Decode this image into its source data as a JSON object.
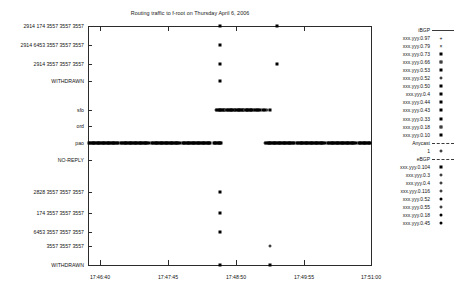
{
  "chart_data": {
    "type": "scatter",
    "title": "Routing traffic to f-root on Thursday April 6, 2006",
    "xlabel": "",
    "ylabel": "",
    "grid": false,
    "legend_position": "right",
    "x_axis": {
      "ticks": [
        "17:46:40",
        "17:47:45",
        "17:48:50",
        "17:49:55",
        "17:51:00"
      ],
      "range": [
        "17:46:40",
        "17:51:00"
      ]
    },
    "y_axis": {
      "categories": [
        "2914 174 3557 3557 3557",
        "2914 6453 3557 3557 3557",
        "2914 3557 3557 3557",
        "WITHDRAWN",
        "sfo",
        "ord",
        "pao",
        "NO-REPLY",
        "2828 3557 3557 3557",
        "174 3557 3557 3557",
        "6453 3557 3557 3557",
        "3557 3557 3557",
        "WITHDRAWN"
      ]
    },
    "series": [
      {
        "name": "xxx.yyy.0.97",
        "group": "iBGP",
        "marker": "plus",
        "points": []
      },
      {
        "name": "xxx.yyy.0.79",
        "group": "iBGP",
        "marker": "cross",
        "points": []
      },
      {
        "name": "xxx.yyy.0.73",
        "group": "iBGP",
        "marker": "filled-square",
        "points": []
      },
      {
        "name": "xxx.yyy.0.66",
        "group": "iBGP",
        "marker": "open-square",
        "points": []
      },
      {
        "name": "xxx.yyy.0.53",
        "group": "iBGP",
        "marker": "filled-square",
        "points": []
      },
      {
        "name": "xxx.yyy.0.52",
        "group": "iBGP",
        "marker": "open-circle",
        "points": []
      },
      {
        "name": "xxx.yyy.0.50",
        "group": "iBGP",
        "marker": "filled-square",
        "points": []
      },
      {
        "name": "xxx.yyy.0.4",
        "group": "iBGP",
        "marker": "filled-square",
        "points": []
      },
      {
        "name": "xxx.yyy.0.44",
        "group": "iBGP",
        "marker": "filled-square",
        "points": []
      },
      {
        "name": "xxx.yyy.0.43",
        "group": "iBGP",
        "marker": "filled-square",
        "points": []
      },
      {
        "name": "xxx.yyy.0.33",
        "group": "iBGP",
        "marker": "filled-square",
        "points": []
      },
      {
        "name": "xxx.yyy.0.18",
        "group": "iBGP",
        "marker": "open-square",
        "points": []
      },
      {
        "name": "xxx.yyy.0.10",
        "group": "iBGP",
        "marker": "filled-square",
        "points": []
      },
      {
        "name": "1",
        "group": "Anycast",
        "marker": "open-circle",
        "points": []
      },
      {
        "name": "xxx.yyy.0.104",
        "group": "eBGP",
        "marker": "filled-square",
        "points": []
      },
      {
        "name": "xxx.yyy.0.3",
        "group": "eBGP",
        "marker": "open-circle",
        "points": []
      },
      {
        "name": "xxx.yyy.0.4",
        "group": "eBGP",
        "marker": "open-circle",
        "points": []
      },
      {
        "name": "xxx.yyy.0.116",
        "group": "eBGP",
        "marker": "open-circle",
        "points": []
      },
      {
        "name": "xxx.yyy.0.52",
        "group": "eBGP",
        "marker": "filled-circle",
        "points": []
      },
      {
        "name": "xxx.yyy.0.55",
        "group": "eBGP",
        "marker": "open-circle",
        "points": []
      },
      {
        "name": "xxx.yyy.0.18",
        "group": "eBGP",
        "marker": "filled-circle",
        "points": []
      },
      {
        "name": "xxx.yyy.0.45",
        "group": "eBGP",
        "marker": "filled-circle",
        "points": []
      }
    ],
    "legend_groups": [
      {
        "header": "iBGP",
        "header_marker": "line",
        "entries": [
          {
            "label": "xxx.yyy.0.97",
            "marker": "plus"
          },
          {
            "label": "xxx.yyy.0.79",
            "marker": "cross"
          },
          {
            "label": "xxx.yyy.0.73",
            "marker": "filled-square"
          },
          {
            "label": "xxx.yyy.0.66",
            "marker": "open-square"
          },
          {
            "label": "xxx.yyy.0.53",
            "marker": "filled-square"
          },
          {
            "label": "xxx.yyy.0.52",
            "marker": "open-circle"
          },
          {
            "label": "xxx.yyy.0.50",
            "marker": "filled-square"
          },
          {
            "label": "xxx.yyy.0.4",
            "marker": "filled-square"
          },
          {
            "label": "xxx.yyy.0.44",
            "marker": "filled-square"
          },
          {
            "label": "xxx.yyy.0.43",
            "marker": "filled-square"
          },
          {
            "label": "xxx.yyy.0.33",
            "marker": "filled-square"
          },
          {
            "label": "xxx.yyy.0.18",
            "marker": "open-square"
          },
          {
            "label": "xxx.yyy.0.10",
            "marker": "filled-square"
          }
        ]
      },
      {
        "header": "Anycast",
        "header_marker": "dashed-line",
        "entries": [
          {
            "label": "1",
            "marker": "open-circle"
          }
        ]
      },
      {
        "header": "eBGP",
        "header_marker": "dashed-line",
        "entries": [
          {
            "label": "xxx.yyy.0.104",
            "marker": "filled-square"
          },
          {
            "label": "xxx.yyy.0.3",
            "marker": "open-circle"
          },
          {
            "label": "xxx.yyy.0.4",
            "marker": "open-circle"
          },
          {
            "label": "xxx.yyy.0.116",
            "marker": "open-circle"
          },
          {
            "label": "xxx.yyy.0.52",
            "marker": "filled-circle"
          },
          {
            "label": "xxx.yyy.0.55",
            "marker": "open-circle"
          },
          {
            "label": "xxx.yyy.0.18",
            "marker": "filled-circle"
          },
          {
            "label": "xxx.yyy.0.45",
            "marker": "filled-circle"
          }
        ]
      }
    ],
    "y_rows": [
      {
        "label": "2914 174 3557 3557 3557",
        "y": 26
      },
      {
        "label": "2914 6453 3557 3557 3557",
        "y": 45
      },
      {
        "label": "2914 3557 3557 3557",
        "y": 64
      },
      {
        "label": "WITHDRAWN",
        "y": 81
      },
      {
        "label": "sfo",
        "y": 110
      },
      {
        "label": "ord",
        "y": 126
      },
      {
        "label": "pao",
        "y": 143
      },
      {
        "label": "NO-REPLY",
        "y": 160
      },
      {
        "label": "2828 3557 3557 3557",
        "y": 192
      },
      {
        "label": "174 3557 3557 3557",
        "y": 213
      },
      {
        "label": "6453 3557 3557 3557",
        "y": 232
      },
      {
        "label": "3557 3557 3557",
        "y": 246
      },
      {
        "label": "WITHDRAWN",
        "y": 265
      }
    ],
    "x_ticks_px": [
      {
        "label": "17:46:40",
        "x": 100
      },
      {
        "label": "17:47:45",
        "x": 168
      },
      {
        "label": "17:48:50",
        "x": 236
      },
      {
        "label": "17:49:55",
        "x": 304
      },
      {
        "label": "17:51:00",
        "x": 371
      }
    ],
    "plotted_points": [
      {
        "x": 220,
        "y": 26,
        "marker": "filled-square"
      },
      {
        "x": 277,
        "y": 26,
        "marker": "filled-square"
      },
      {
        "x": 220,
        "y": 45,
        "marker": "filled-square"
      },
      {
        "x": 220,
        "y": 64,
        "marker": "filled-square"
      },
      {
        "x": 277,
        "y": 64,
        "marker": "filled-square"
      },
      {
        "x": 220,
        "y": 81,
        "marker": "filled-square"
      },
      {
        "x": 220,
        "y": 192,
        "marker": "filled-square"
      },
      {
        "x": 220,
        "y": 213,
        "marker": "filled-square"
      },
      {
        "x": 220,
        "y": 232,
        "marker": "filled-square"
      },
      {
        "x": 270,
        "y": 246,
        "marker": "open-circle"
      },
      {
        "x": 220,
        "y": 265,
        "marker": "filled-square"
      },
      {
        "x": 270,
        "y": 265,
        "marker": "filled-square"
      }
    ],
    "sfo_band": {
      "y": 110,
      "x_start": 216,
      "x_end": 272
    },
    "pao_bands": [
      {
        "y": 143,
        "x_start": 89,
        "x_end": 222
      },
      {
        "y": 143,
        "x_start": 265,
        "x_end": 371
      }
    ]
  }
}
